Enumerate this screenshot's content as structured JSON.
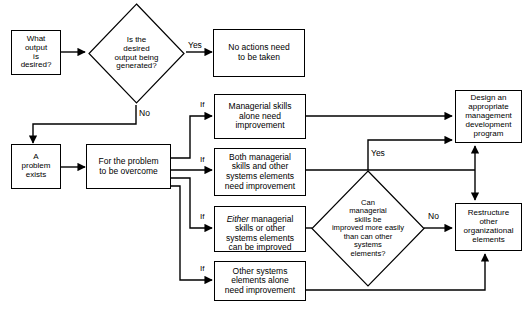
{
  "diagram": {
    "background_color": "#ffffff",
    "line_color": "#000000",
    "text_color": "#000000"
  },
  "nodes": {
    "what_output": {
      "text": "What\noutput\nis\ndesired?",
      "shape": "rectangle"
    },
    "is_desired_output": {
      "text": "Is the\ndesired\noutput being\ngenerated?",
      "shape": "diamond"
    },
    "no_actions": {
      "text": "No actions need\nto be taken",
      "shape": "rectangle"
    },
    "problem_exists": {
      "text": "A\nproblem\nexists",
      "shape": "rectangle"
    },
    "for_problem": {
      "text": "For the problem\nto be overcome",
      "shape": "rectangle"
    },
    "managerial_alone": {
      "text": "Managerial skills\nalone need\nimprovement",
      "shape": "rectangle"
    },
    "both_managerial": {
      "text": "Both managerial\nskills and other\nsystems elements\nneed improvement",
      "shape": "rectangle"
    },
    "either_managerial_prefix": {
      "text": "Either",
      "shape": "text-run-italic"
    },
    "either_managerial_rest": {
      "text": " managerial\nskills or other\nsystems elements\ncan be improved",
      "shape": "text-run"
    },
    "other_systems_alone": {
      "text": "Other systems\nelements alone\nneed improvement",
      "shape": "rectangle"
    },
    "can_managerial": {
      "text": "Can\nmanagerial\nskills be\nimproved more easily\nthan can other\nsystems\nelements?",
      "shape": "diamond"
    },
    "design_program": {
      "text": "Design an\nappropriate\nmanagement\ndevelopment\nprogram",
      "shape": "rectangle"
    },
    "restructure": {
      "text": "Restructure\nother\norganizational\nelements",
      "shape": "rectangle"
    }
  },
  "edge_labels": {
    "yes_top": "Yes",
    "no_top": "No",
    "if_managerial": "If",
    "if_both": "If",
    "if_either": "If",
    "if_other": "If",
    "yes_diamond": "Yes",
    "no_diamond": "No"
  }
}
